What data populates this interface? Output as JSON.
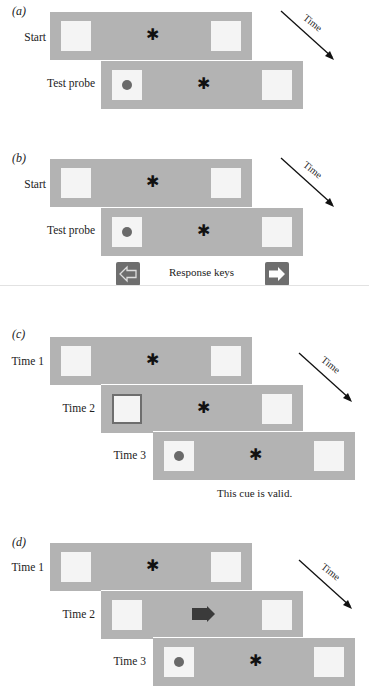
{
  "panels": {
    "a": {
      "label": "(a)",
      "rows": [
        "Start",
        "Test probe"
      ],
      "time_label": "Time"
    },
    "b": {
      "label": "(b)",
      "rows": [
        "Start",
        "Test probe"
      ],
      "time_label": "Time",
      "response_keys_label": "Response keys",
      "keys": [
        "left-arrow-key",
        "right-arrow-key"
      ]
    },
    "c": {
      "label": "(c)",
      "rows": [
        "Time 1",
        "Time 2",
        "Time 3"
      ],
      "time_label": "Time",
      "caption": "This cue is valid."
    },
    "d": {
      "label": "(d)",
      "rows": [
        "Time 1",
        "Time 2",
        "Time 3"
      ],
      "time_label": "Time"
    }
  },
  "colors": {
    "frame": "#b3b3b3",
    "box": "#f4f4f4",
    "target_dot": "#6a6a6a",
    "cue_arrow": "#3a3a3a",
    "cue_border": "#6e6e6e",
    "key_bg": "#6e6e6e"
  }
}
